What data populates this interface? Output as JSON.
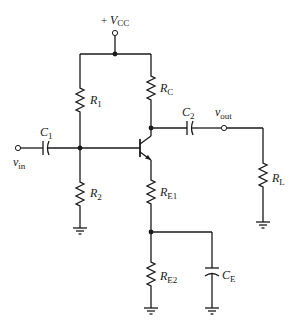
{
  "diagram": {
    "type": "common-emitter amplifier with voltage-divider bias and split emitter resistor",
    "labels": {
      "vcc": {
        "prefix": "+ ",
        "main": "V",
        "sub": "CC"
      },
      "r1": {
        "main": "R",
        "sub": "1"
      },
      "r2": {
        "main": "R",
        "sub": "2"
      },
      "rc": {
        "main": "R",
        "sub": "C"
      },
      "re1": {
        "main": "R",
        "sub": "E1"
      },
      "re2": {
        "main": "R",
        "sub": "E2"
      },
      "rl": {
        "main": "R",
        "sub": "L"
      },
      "c1": {
        "main": "C",
        "sub": "1"
      },
      "c2": {
        "main": "C",
        "sub": "2"
      },
      "ce": {
        "main": "C",
        "sub": "E"
      },
      "vin": {
        "main": "v",
        "sub": "in"
      },
      "vout": {
        "main": "v",
        "sub": "out"
      }
    },
    "components": [
      "R1",
      "R2",
      "RC",
      "RE1",
      "RE2",
      "RL",
      "C1",
      "C2",
      "CE",
      "Q1 (NPN)"
    ],
    "colors": {
      "ink": "#1a1a1a",
      "background": "#ffffff"
    }
  }
}
